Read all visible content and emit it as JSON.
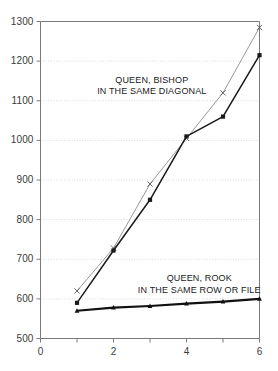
{
  "chart_data": {
    "type": "line",
    "title": "",
    "subtitle": "",
    "xlabel": "",
    "ylabel": "",
    "xlim": [
      0,
      6
    ],
    "ylim": [
      500,
      1300
    ],
    "x_ticks": [
      0,
      1,
      2,
      3,
      4,
      5,
      6
    ],
    "x_tick_labels": [
      "0",
      "",
      "2",
      "",
      "4",
      "",
      "6"
    ],
    "y_ticks": [
      500,
      600,
      700,
      800,
      900,
      1000,
      1100,
      1200,
      1300
    ],
    "y_tick_labels": [
      "500",
      "600",
      "700",
      "800",
      "900",
      "1000",
      "1100",
      "1200",
      "1300"
    ],
    "grid": true,
    "grid_style": "dotted-horizontal",
    "legend": "inline-annotations",
    "x": [
      1,
      2,
      3,
      4,
      5,
      6
    ],
    "series": [
      {
        "name": "queen-bishop-same-diagonal-upper",
        "marker": "x",
        "color": "#8c8c8c",
        "values": [
          620,
          728,
          890,
          1005,
          1120,
          1285
        ]
      },
      {
        "name": "queen-bishop-same-diagonal-lower",
        "marker": "filled-square",
        "color": "#1a1a1a",
        "values": [
          590,
          722,
          850,
          1010,
          1060,
          1215
        ]
      },
      {
        "name": "queen-rook-same-row-or-file",
        "marker": "filled-triangle",
        "color": "#111111",
        "values": [
          570,
          578,
          582,
          588,
          593,
          600
        ]
      }
    ],
    "annotations": [
      {
        "name": "queen-bishop-label",
        "lines": [
          "QUEEN, BISHOP",
          "IN THE SAME DIAGONAL"
        ],
        "x": 3.05,
        "y": 1165
      },
      {
        "name": "queen-rook-label",
        "lines": [
          "QUEEN, ROOK",
          "IN THE SAME ROW OR FILE"
        ],
        "x": 4.35,
        "y": 665
      }
    ],
    "colors": {
      "axis": "#7a7a7a",
      "grid": "#c9c9c9",
      "background": "#ffffff",
      "text": "#3a3a3a",
      "series_light": "#8c8c8c",
      "series_dark": "#1a1a1a"
    }
  }
}
